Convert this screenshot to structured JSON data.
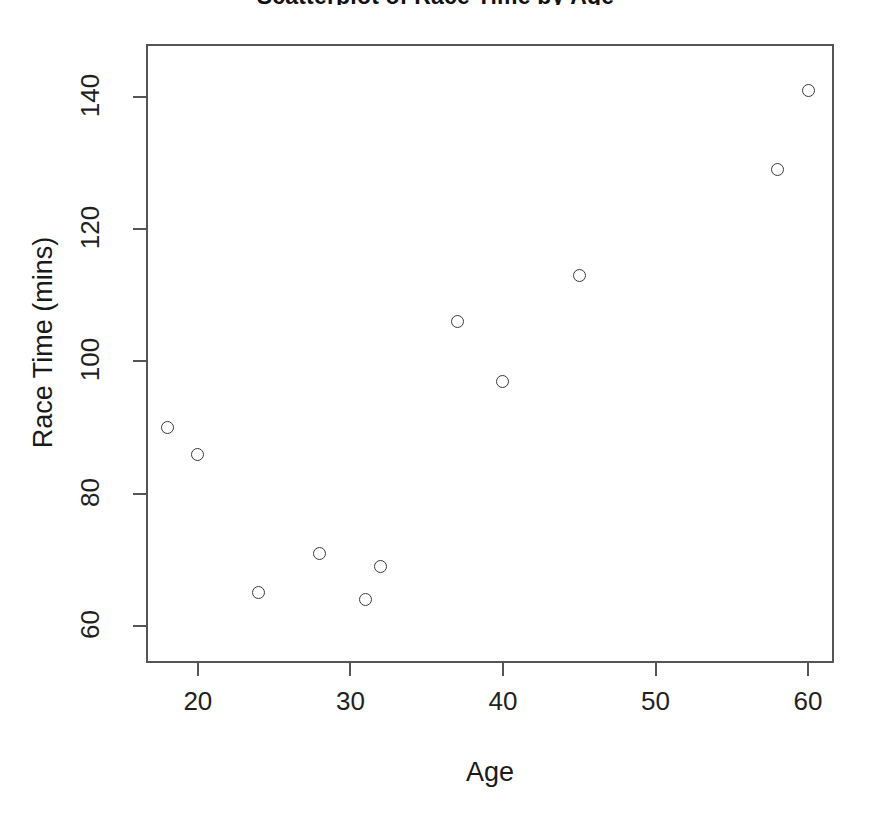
{
  "chart_data": {
    "type": "scatter",
    "title": "Scatterplot of Race Time by Age",
    "xlabel": "Age",
    "ylabel": "Race Time (mins)",
    "xlim": [
      16.6,
      61.7
    ],
    "ylim": [
      54.4,
      148.0
    ],
    "grid": false,
    "legend": null,
    "marker": "open-circle",
    "marker_color": "#3a3a3a",
    "xticks": [
      20,
      30,
      40,
      50,
      60
    ],
    "xtick_labels": [
      "20",
      "30",
      "40",
      "50",
      "60"
    ],
    "yticks": [
      60,
      80,
      100,
      120,
      140
    ],
    "ytick_labels": [
      "60",
      "80",
      "100",
      "120",
      "140"
    ],
    "x": [
      18,
      20,
      24,
      28,
      31,
      32,
      37,
      40,
      45,
      58,
      60
    ],
    "y": [
      90,
      86,
      65,
      71,
      64,
      69,
      106,
      97,
      113,
      129,
      141
    ],
    "points": [
      {
        "x": 18,
        "y": 90
      },
      {
        "x": 20,
        "y": 86
      },
      {
        "x": 24,
        "y": 65
      },
      {
        "x": 28,
        "y": 71
      },
      {
        "x": 31,
        "y": 64
      },
      {
        "x": 32,
        "y": 69
      },
      {
        "x": 37,
        "y": 106
      },
      {
        "x": 40,
        "y": 97
      },
      {
        "x": 45,
        "y": 113
      },
      {
        "x": 58,
        "y": 129
      },
      {
        "x": 60,
        "y": 141
      }
    ]
  }
}
